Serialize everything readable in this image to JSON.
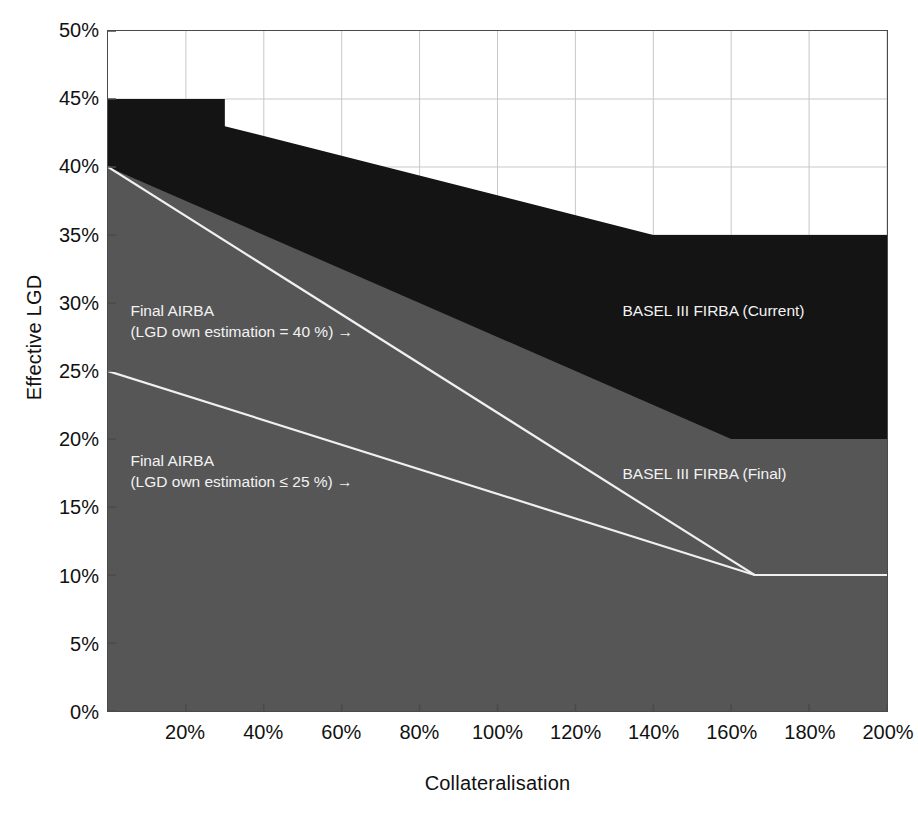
{
  "chart_data": {
    "type": "area",
    "title": "",
    "subtitle": "",
    "xlabel": "Collateralisation",
    "ylabel": "Effective LGD",
    "xlim": [
      0,
      200
    ],
    "ylim": [
      0,
      50
    ],
    "xtick_labels": [
      "20%",
      "40%",
      "60%",
      "80%",
      "100%",
      "120%",
      "140%",
      "160%",
      "180%",
      "200%"
    ],
    "xtick_values": [
      20,
      40,
      60,
      80,
      100,
      120,
      140,
      160,
      180,
      200
    ],
    "ytick_labels": [
      "0%",
      "5%",
      "10%",
      "15%",
      "20%",
      "25%",
      "30%",
      "35%",
      "40%",
      "45%",
      "50%"
    ],
    "ytick_values": [
      0,
      5,
      10,
      15,
      20,
      25,
      30,
      35,
      40,
      45,
      50
    ],
    "grid": true,
    "grid_color": "#c8c8c8",
    "legend_position": "in-plot annotations",
    "series": [
      {
        "name": "BASEL III FIRBA (Current)",
        "kind": "area-upper-boundary",
        "fill_color": "#141414",
        "x": [
          0,
          30,
          30,
          140,
          200
        ],
        "values": [
          45,
          45,
          43,
          35,
          35
        ]
      },
      {
        "name": "BASEL III FIRBA (Final)",
        "kind": "area-upper-boundary",
        "fill_color": "#565656",
        "x": [
          0,
          160,
          200
        ],
        "values": [
          40,
          20,
          20
        ]
      },
      {
        "name": "Final AIRBA (LGD own estimation = 40 %)",
        "kind": "line",
        "line_color": "#f0f0f0",
        "x": [
          0,
          166,
          200
        ],
        "values": [
          40,
          10,
          10
        ]
      },
      {
        "name": "Final AIRBA (LGD own estimation <= 25 %)",
        "kind": "line",
        "line_color": "#f0f0f0",
        "x": [
          0,
          166,
          200
        ],
        "values": [
          25,
          10,
          10
        ]
      }
    ],
    "annotations": [
      {
        "id": "annot-airba-40",
        "line1": "Final AIRBA",
        "line2": "(LGD own estimation = 40 %) →",
        "x": 6,
        "y": 29.5
      },
      {
        "id": "annot-airba-25",
        "line1": "Final AIRBA",
        "line2": "(LGD own estimation ≤ 25 %) →",
        "x": 6,
        "y": 18.5
      },
      {
        "id": "annot-firba-current",
        "line1": "BASEL III FIRBA (Current)",
        "x": 132,
        "y": 29.5
      },
      {
        "id": "annot-firba-final",
        "line1": "BASEL III FIRBA (Final)",
        "x": 132,
        "y": 17.5
      }
    ]
  },
  "colors": {
    "current_fill": "#141414",
    "final_fill": "#565656",
    "line": "#f0f0f0",
    "grid": "#c8c8c8",
    "axis": "#4a4a4a",
    "background": "#ffffff",
    "text": "#111111",
    "annotation_text": "#f2f2f2"
  }
}
